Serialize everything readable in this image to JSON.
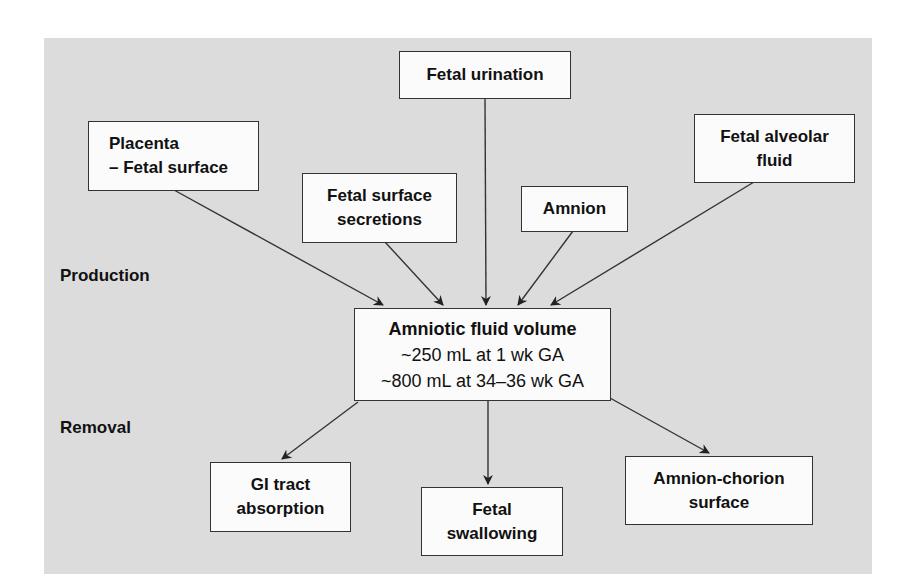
{
  "diagram": {
    "section_labels": {
      "production": "Production",
      "removal": "Removal"
    },
    "center": {
      "title": "Amniotic fluid volume",
      "line1": "~250 mL at 1 wk GA",
      "line2": "~800 mL at 34–36 wk GA"
    },
    "production_sources": [
      {
        "lines": [
          "Placenta",
          "– Fetal surface"
        ]
      },
      {
        "lines": [
          "Fetal surface",
          "secretions"
        ]
      },
      {
        "lines": [
          "Fetal urination"
        ]
      },
      {
        "lines": [
          "Amnion"
        ]
      },
      {
        "lines": [
          "Fetal alveolar",
          "fluid"
        ]
      }
    ],
    "removal_targets": [
      {
        "lines": [
          "GI tract",
          "absorption"
        ]
      },
      {
        "lines": [
          "Fetal",
          "swallowing"
        ]
      },
      {
        "lines": [
          "Amnion-chorion",
          "surface"
        ]
      }
    ],
    "colors": {
      "background_panel": "#dcdcdc",
      "box_fill": "#fbfbfb",
      "stroke": "#333333"
    }
  }
}
